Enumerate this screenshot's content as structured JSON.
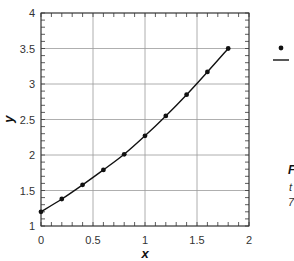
{
  "chart_data": {
    "type": "line",
    "title": "",
    "xlabel": "x",
    "ylabel": "y",
    "xlim": [
      0,
      2
    ],
    "ylim": [
      1,
      4
    ],
    "grid": true,
    "x_ticks": [
      "0",
      "0.5",
      "1",
      "1.5",
      "2"
    ],
    "y_ticks": [
      "1",
      "1.5",
      "2",
      "2.5",
      "3",
      "3.5",
      "4"
    ],
    "series": [
      {
        "name": "points",
        "style": "markers",
        "x": [
          0,
          0.2,
          0.4,
          0.6,
          0.8,
          1.0,
          1.2,
          1.4,
          1.6,
          1.8
        ],
        "y": [
          1.2,
          1.38,
          1.58,
          1.79,
          2.01,
          2.27,
          2.55,
          2.85,
          3.17,
          3.5
        ]
      },
      {
        "name": "curve",
        "style": "line",
        "x": [
          0,
          0.2,
          0.4,
          0.6,
          0.8,
          1.0,
          1.2,
          1.4,
          1.6,
          1.8
        ],
        "y": [
          1.2,
          1.38,
          1.58,
          1.79,
          2.01,
          2.27,
          2.55,
          2.85,
          3.17,
          3.5
        ]
      }
    ],
    "legend": {
      "position": "right",
      "entries": [
        {
          "symbol": "dot",
          "label": ""
        },
        {
          "symbol": "line",
          "label": ""
        }
      ]
    }
  },
  "side_text": {
    "line1": "F",
    "line2": "t",
    "line3": "7"
  },
  "colors": {
    "line": "#111111",
    "grid": "#9a9a9a",
    "axis": "#333333"
  }
}
